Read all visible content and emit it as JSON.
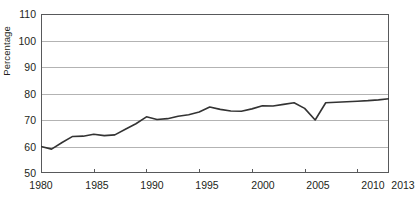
{
  "chart_data": {
    "type": "line",
    "title": "",
    "xlabel": "",
    "ylabel": "Percentage",
    "xlim": [
      1980,
      2013
    ],
    "ylim": [
      50,
      110
    ],
    "ytick_values": [
      50,
      60,
      70,
      80,
      90,
      100,
      110
    ],
    "ytick_labels": [
      "50",
      "60",
      "70",
      "80",
      "90",
      "100",
      "110"
    ],
    "xtick_values": [
      1980,
      1985,
      1990,
      1995,
      2000,
      2005,
      2010,
      2013
    ],
    "xtick_labels": [
      "1980",
      "1985",
      "1990",
      "1995",
      "2000",
      "2005",
      "2010",
      "2013"
    ],
    "grid": "horizontal",
    "legend": "none",
    "line_color": "#333333",
    "grid_color": "#b3b3b3",
    "axis_color": "#58595b",
    "x": [
      1980,
      1981,
      1982,
      1983,
      1984,
      1985,
      1986,
      1987,
      1988,
      1989,
      1990,
      1991,
      1992,
      1993,
      1994,
      1995,
      1996,
      1997,
      1998,
      1999,
      2000,
      2001,
      2002,
      2003,
      2004,
      2005,
      2006,
      2007,
      2008,
      2009,
      2010,
      2011,
      2012,
      2013
    ],
    "series": [
      {
        "name": "Percentage",
        "values": [
          60.0,
          59.0,
          61.5,
          63.8,
          63.9,
          64.6,
          64.1,
          64.4,
          66.5,
          68.6,
          71.2,
          70.2,
          70.5,
          71.4,
          72.0,
          73.0,
          74.9,
          74.0,
          73.4,
          73.3,
          74.2,
          75.4,
          75.3,
          75.9,
          76.5,
          74.4,
          70.0,
          76.5,
          76.7,
          76.9,
          77.1,
          77.3,
          77.6,
          78.0
        ]
      }
    ]
  }
}
